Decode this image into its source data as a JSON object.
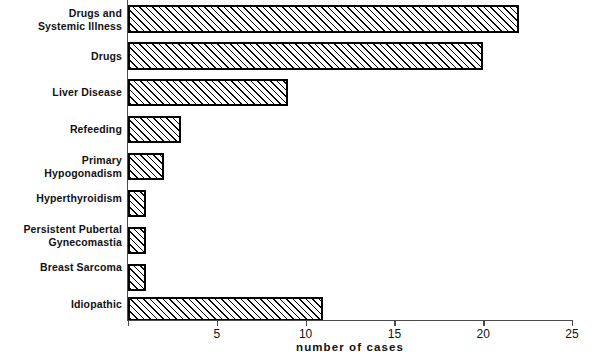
{
  "chart_data": {
    "type": "bar",
    "orientation": "horizontal",
    "title": "",
    "xlabel": "number of cases",
    "ylabel": "",
    "xlim": [
      0,
      25
    ],
    "xticks": [
      0,
      5,
      10,
      15,
      20,
      25
    ],
    "xtick_labels": [
      "",
      "5",
      "10",
      "15",
      "20",
      "25"
    ],
    "grid": false,
    "legend": null,
    "categories": [
      "Drugs and\nSystemic Illness",
      "Drugs",
      "Liver Disease",
      "Refeeding",
      "Primary\nHypogonadism",
      "Hyperthyroidism",
      "Persistent Pubertal\nGynecomastia",
      "Breast Sarcoma",
      "Idiopathic"
    ],
    "values": [
      22,
      20,
      9,
      3,
      2,
      1,
      1,
      1,
      11
    ]
  },
  "style": {
    "bar_fill": "#ffffff",
    "bar_hatch": "forward-diagonal",
    "bar_edge_color": "#000000",
    "axis_color": "#4a4a4a",
    "text_color": "#111111",
    "background": "#ffffff"
  }
}
